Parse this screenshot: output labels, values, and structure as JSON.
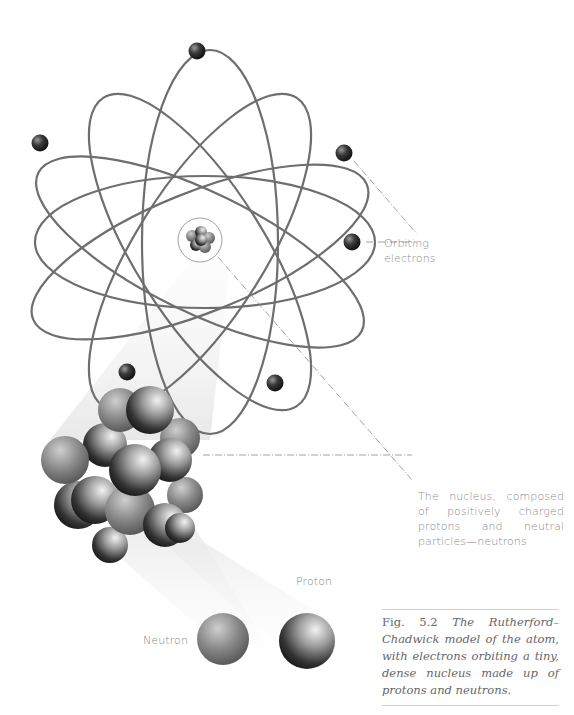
{
  "figure": {
    "number": "Fig. 5.2",
    "caption": "The Rutherford–Chadwick model of the atom, with electrons orbiting a tiny, dense nucleus made up of protons and neutrons."
  },
  "labels": {
    "orbiting_electrons_line1": "Orbiting",
    "orbiting_electrons_line2": "electrons",
    "nucleus": "The nucleus, composed of positively charged protons and neutral particles—neutrons",
    "proton": "Proton",
    "neutron": "Neutron"
  },
  "colors": {
    "orbit": "#6e6e6e",
    "electron": "#2a2a2a",
    "label_text": "#8a8a8a",
    "caption_text": "#666666",
    "rule": "#cfcfcf",
    "beam": "#eeeeee"
  },
  "atom": {
    "center": [
      212,
      241
    ],
    "electron_count": 6,
    "orbit_count": 5
  }
}
